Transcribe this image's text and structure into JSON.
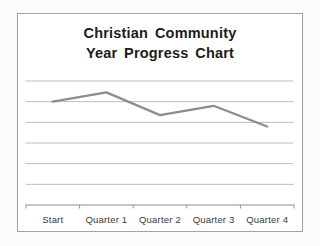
{
  "chart_data": {
    "type": "line",
    "title": "Christian Community Year Progress Chart",
    "title_lines": [
      "Christian Community",
      "Year Progress Chart"
    ],
    "categories": [
      "Start",
      "Quarter 1",
      "Quarter 2",
      "Quarter 3",
      "Quarter 4"
    ],
    "series": [
      {
        "name": "Year Progress",
        "values": [
          5.0,
          5.45,
          4.35,
          4.8,
          3.8
        ]
      }
    ],
    "xlabel": "",
    "ylabel": "",
    "ylim": [
      0,
      6
    ],
    "gridline_step": 1,
    "y_axis_labels_visible": false,
    "legend": "none",
    "grid": "horizontal",
    "markers": "none",
    "colors": {
      "series_line": "#8d8d8d",
      "gridline": "#b5b5b5",
      "axis": "#8f8f8f",
      "title_text": "#1c1c1c",
      "label_text": "#3a3a3a",
      "frame_border": "#a2a2a2",
      "plot_background": "#ffffff",
      "page_background": "#fbfbfb"
    }
  }
}
